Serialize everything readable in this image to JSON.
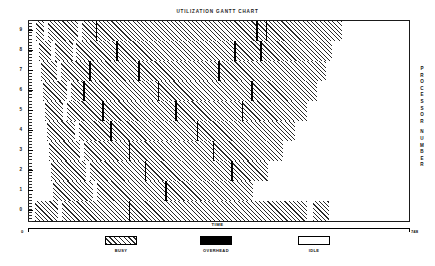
{
  "chart_data": {
    "type": "gantt",
    "title": "UTILIZATION GANTT CHART",
    "xlabel": "TIME",
    "ylabel": "PROCESSOR NUMBER",
    "xlim": [
      0,
      748
    ],
    "x_tick_labels": [
      "0",
      "748"
    ],
    "ylim": [
      0,
      9
    ],
    "y_tick_labels": [
      "9",
      "8",
      "7",
      "6",
      "5",
      "4",
      "3",
      "2",
      "1",
      "0"
    ],
    "grid": false,
    "legend_position": "bottom",
    "legend": [
      {
        "label": "BUSY",
        "pattern": "diagonal-hatch"
      },
      {
        "label": "OVERHEAD",
        "pattern": "solid-black"
      },
      {
        "label": "IDLE",
        "pattern": "white-empty"
      }
    ],
    "state_colors": {
      "busy": "#2b2b2b",
      "overhead": "#000000",
      "idle": "#ffffff",
      "frame": "#1a1a1a"
    },
    "rows": [
      {
        "processor": "9",
        "end_time": 616,
        "segments": [
          {
            "state": "idle",
            "start": 0,
            "end": 14
          },
          {
            "state": "busy",
            "start": 14,
            "end": 29
          },
          {
            "state": "idle",
            "start": 29,
            "end": 37
          },
          {
            "state": "busy",
            "start": 37,
            "end": 96
          },
          {
            "state": "idle",
            "start": 96,
            "end": 104
          },
          {
            "state": "busy",
            "start": 104,
            "end": 131
          },
          {
            "state": "overhead",
            "start": 131,
            "end": 134
          },
          {
            "state": "busy",
            "start": 134,
            "end": 447
          },
          {
            "state": "overhead",
            "start": 447,
            "end": 450
          },
          {
            "state": "busy",
            "start": 450,
            "end": 466
          },
          {
            "state": "overhead",
            "start": 466,
            "end": 469
          },
          {
            "state": "busy",
            "start": 469,
            "end": 616
          },
          {
            "state": "idle",
            "start": 616,
            "end": 748
          }
        ]
      },
      {
        "processor": "8",
        "end_time": 596,
        "segments": [
          {
            "state": "idle",
            "start": 0,
            "end": 20
          },
          {
            "state": "busy",
            "start": 20,
            "end": 43
          },
          {
            "state": "idle",
            "start": 43,
            "end": 51
          },
          {
            "state": "busy",
            "start": 51,
            "end": 86
          },
          {
            "state": "idle",
            "start": 86,
            "end": 92
          },
          {
            "state": "busy",
            "start": 92,
            "end": 172
          },
          {
            "state": "overhead",
            "start": 172,
            "end": 175
          },
          {
            "state": "busy",
            "start": 175,
            "end": 404
          },
          {
            "state": "overhead",
            "start": 404,
            "end": 407
          },
          {
            "state": "busy",
            "start": 407,
            "end": 455
          },
          {
            "state": "overhead",
            "start": 455,
            "end": 458
          },
          {
            "state": "busy",
            "start": 458,
            "end": 596
          },
          {
            "state": "idle",
            "start": 596,
            "end": 748
          }
        ]
      },
      {
        "processor": "7",
        "end_time": 584,
        "segments": [
          {
            "state": "idle",
            "start": 0,
            "end": 23
          },
          {
            "state": "busy",
            "start": 23,
            "end": 55
          },
          {
            "state": "idle",
            "start": 55,
            "end": 63
          },
          {
            "state": "busy",
            "start": 63,
            "end": 119
          },
          {
            "state": "overhead",
            "start": 119,
            "end": 122
          },
          {
            "state": "busy",
            "start": 122,
            "end": 215
          },
          {
            "state": "overhead",
            "start": 215,
            "end": 218
          },
          {
            "state": "busy",
            "start": 218,
            "end": 373
          },
          {
            "state": "overhead",
            "start": 373,
            "end": 376
          },
          {
            "state": "busy",
            "start": 376,
            "end": 584
          },
          {
            "state": "idle",
            "start": 584,
            "end": 748
          }
        ]
      },
      {
        "processor": "6",
        "end_time": 566,
        "segments": [
          {
            "state": "idle",
            "start": 0,
            "end": 27
          },
          {
            "state": "busy",
            "start": 27,
            "end": 74
          },
          {
            "state": "idle",
            "start": 74,
            "end": 82
          },
          {
            "state": "busy",
            "start": 82,
            "end": 107
          },
          {
            "state": "overhead",
            "start": 107,
            "end": 110
          },
          {
            "state": "busy",
            "start": 110,
            "end": 253
          },
          {
            "state": "overhead",
            "start": 253,
            "end": 256
          },
          {
            "state": "busy",
            "start": 256,
            "end": 437
          },
          {
            "state": "overhead",
            "start": 437,
            "end": 440
          },
          {
            "state": "busy",
            "start": 440,
            "end": 566
          },
          {
            "state": "idle",
            "start": 566,
            "end": 748
          }
        ]
      },
      {
        "processor": "5",
        "end_time": 548,
        "segments": [
          {
            "state": "idle",
            "start": 0,
            "end": 31
          },
          {
            "state": "busy",
            "start": 31,
            "end": 66
          },
          {
            "state": "idle",
            "start": 66,
            "end": 74
          },
          {
            "state": "busy",
            "start": 74,
            "end": 144
          },
          {
            "state": "overhead",
            "start": 144,
            "end": 147
          },
          {
            "state": "busy",
            "start": 147,
            "end": 288
          },
          {
            "state": "overhead",
            "start": 288,
            "end": 291
          },
          {
            "state": "busy",
            "start": 291,
            "end": 419
          },
          {
            "state": "overhead",
            "start": 419,
            "end": 422
          },
          {
            "state": "busy",
            "start": 422,
            "end": 548
          },
          {
            "state": "idle",
            "start": 548,
            "end": 748
          }
        ]
      },
      {
        "processor": "4",
        "end_time": 524,
        "segments": [
          {
            "state": "idle",
            "start": 0,
            "end": 35
          },
          {
            "state": "busy",
            "start": 35,
            "end": 90
          },
          {
            "state": "idle",
            "start": 90,
            "end": 98
          },
          {
            "state": "busy",
            "start": 98,
            "end": 160
          },
          {
            "state": "overhead",
            "start": 160,
            "end": 163
          },
          {
            "state": "busy",
            "start": 163,
            "end": 330
          },
          {
            "state": "overhead",
            "start": 330,
            "end": 333
          },
          {
            "state": "busy",
            "start": 333,
            "end": 524
          },
          {
            "state": "idle",
            "start": 524,
            "end": 748
          }
        ]
      },
      {
        "processor": "3",
        "end_time": 500,
        "segments": [
          {
            "state": "idle",
            "start": 0,
            "end": 39
          },
          {
            "state": "busy",
            "start": 39,
            "end": 100
          },
          {
            "state": "idle",
            "start": 100,
            "end": 108
          },
          {
            "state": "busy",
            "start": 108,
            "end": 196
          },
          {
            "state": "overhead",
            "start": 196,
            "end": 199
          },
          {
            "state": "busy",
            "start": 199,
            "end": 362
          },
          {
            "state": "overhead",
            "start": 362,
            "end": 365
          },
          {
            "state": "busy",
            "start": 365,
            "end": 500
          },
          {
            "state": "idle",
            "start": 500,
            "end": 748
          }
        ]
      },
      {
        "processor": "2",
        "end_time": 470,
        "segments": [
          {
            "state": "idle",
            "start": 0,
            "end": 43
          },
          {
            "state": "busy",
            "start": 43,
            "end": 112
          },
          {
            "state": "idle",
            "start": 112,
            "end": 120
          },
          {
            "state": "busy",
            "start": 120,
            "end": 228
          },
          {
            "state": "overhead",
            "start": 228,
            "end": 231
          },
          {
            "state": "busy",
            "start": 231,
            "end": 398
          },
          {
            "state": "overhead",
            "start": 398,
            "end": 401
          },
          {
            "state": "busy",
            "start": 401,
            "end": 470
          },
          {
            "state": "idle",
            "start": 470,
            "end": 748
          }
        ]
      },
      {
        "processor": "1",
        "end_time": 440,
        "segments": [
          {
            "state": "idle",
            "start": 0,
            "end": 47
          },
          {
            "state": "busy",
            "start": 47,
            "end": 126
          },
          {
            "state": "idle",
            "start": 126,
            "end": 134
          },
          {
            "state": "busy",
            "start": 134,
            "end": 268
          },
          {
            "state": "overhead",
            "start": 268,
            "end": 271
          },
          {
            "state": "busy",
            "start": 271,
            "end": 440
          },
          {
            "state": "idle",
            "start": 440,
            "end": 748
          }
        ]
      },
      {
        "processor": "0",
        "end_time": 590,
        "segments": [
          {
            "state": "idle",
            "start": 0,
            "end": 12
          },
          {
            "state": "busy",
            "start": 12,
            "end": 58
          },
          {
            "state": "idle",
            "start": 58,
            "end": 64
          },
          {
            "state": "busy",
            "start": 64,
            "end": 196
          },
          {
            "state": "overhead",
            "start": 196,
            "end": 199
          },
          {
            "state": "busy",
            "start": 199,
            "end": 548
          },
          {
            "state": "idle",
            "start": 548,
            "end": 560
          },
          {
            "state": "busy",
            "start": 560,
            "end": 590
          },
          {
            "state": "idle",
            "start": 590,
            "end": 748
          }
        ]
      }
    ]
  },
  "legend_items": [
    {
      "label": "BUSY"
    },
    {
      "label": "OVERHEAD"
    },
    {
      "label": "IDLE"
    }
  ],
  "axis": {
    "x_start_label": "0",
    "x_end_label": "748",
    "time_label": "TIME",
    "processor_title_letters": [
      "P",
      "R",
      "O",
      "C",
      "E",
      "S",
      "S",
      "O",
      "R",
      "N",
      "U",
      "M",
      "B",
      "E",
      "R"
    ]
  }
}
